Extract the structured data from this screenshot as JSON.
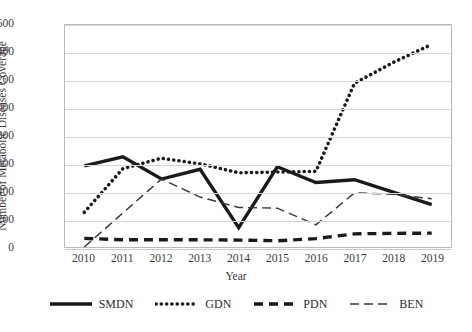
{
  "chart_data": {
    "type": "line",
    "title": "",
    "xlabel": "Year",
    "ylabel": "Number of Metabolic Diseases Coverage",
    "categories": [
      "2010",
      "2011",
      "2012",
      "2013",
      "2014",
      "2015",
      "2016",
      "2017",
      "2018",
      "2019"
    ],
    "x": [
      2010,
      2011,
      2012,
      2013,
      2014,
      2015,
      2016,
      2017,
      2018,
      2019
    ],
    "ylim": [
      0,
      1600
    ],
    "ytick_values": [
      0,
      200,
      400,
      600,
      800,
      1000,
      1200,
      1400,
      1600
    ],
    "ytick_labels": [
      "0",
      "200",
      "400",
      "600",
      "800",
      "1000",
      "1200",
      "1400",
      "1600"
    ],
    "grid": true,
    "legend_position": "bottom",
    "series": [
      {
        "name": "SMDN",
        "style": "solid-thick",
        "color": "#1a1a1a",
        "values": [
          585,
          650,
          490,
          560,
          140,
          578,
          465,
          485,
          395,
          305
        ]
      },
      {
        "name": "GDN",
        "style": "dotted",
        "color": "#1a1a1a",
        "values": [
          250,
          565,
          640,
          600,
          535,
          540,
          545,
          1180,
          1330,
          1460
        ]
      },
      {
        "name": "PDN",
        "style": "dashed-thick",
        "color": "#1a1a1a",
        "values": [
          62,
          52,
          52,
          52,
          50,
          45,
          60,
          95,
          98,
          100
        ]
      },
      {
        "name": "BEN",
        "style": "dashed-thin",
        "color": "#3a3a3a",
        "values": [
          0,
          245,
          490,
          360,
          285,
          280,
          160,
          390,
          380,
          348
        ]
      }
    ]
  },
  "legend": {
    "items": [
      {
        "label": "SMDN",
        "swatch": "solid-thick-swatch"
      },
      {
        "label": "GDN",
        "swatch": "dotted-swatch"
      },
      {
        "label": "PDN",
        "swatch": "dashed-thick-swatch"
      },
      {
        "label": "BEN",
        "swatch": "dashed-thin-swatch"
      }
    ]
  }
}
